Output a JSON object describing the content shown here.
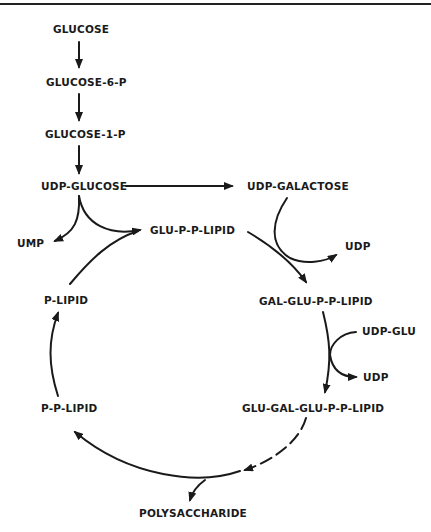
{
  "diagram": {
    "type": "metabolic-pathway",
    "nodes": {
      "glucose": "GLUCOSE",
      "glucose_6_p": "GLUCOSE-6-P",
      "glucose_1_p": "GLUCOSE-1-P",
      "udp_glucose": "UDP-GLUCOSE",
      "udp_galactose": "UDP-GALACTOSE",
      "ump": "UMP",
      "glu_p_p_lipid": "GLU-P-P-LIPID",
      "udp_1": "UDP",
      "p_lipid": "P-LIPID",
      "gal_glu_p_p_lipid": "GAL-GLU-P-P-LIPID",
      "udp_glu": "UDP-GLU",
      "udp_2": "UDP",
      "p_p_lipid": "P-P-LIPID",
      "glu_gal_glu_p_p_lipid": "GLU-GAL-GLU-P-P-LIPID",
      "polysaccharide": "POLYSACCHARIDE"
    },
    "edges": [
      {
        "from": "GLUCOSE",
        "to": "GLUCOSE-6-P"
      },
      {
        "from": "GLUCOSE-6-P",
        "to": "GLUCOSE-1-P"
      },
      {
        "from": "GLUCOSE-1-P",
        "to": "UDP-GLUCOSE"
      },
      {
        "from": "UDP-GLUCOSE",
        "to": "UDP-GALACTOSE"
      },
      {
        "from": "UDP-GLUCOSE",
        "to": "UMP"
      },
      {
        "from": "UDP-GLUCOSE",
        "to": "GLU-P-P-LIPID"
      },
      {
        "from": "P-LIPID",
        "to": "GLU-P-P-LIPID"
      },
      {
        "from": "GLU-P-P-LIPID",
        "to": "GAL-GLU-P-P-LIPID"
      },
      {
        "from": "UDP-GALACTOSE",
        "to": "UDP"
      },
      {
        "from": "GAL-GLU-P-P-LIPID",
        "to": "GLU-GAL-GLU-P-P-LIPID"
      },
      {
        "from": "UDP-GLU",
        "to": "UDP"
      },
      {
        "from": "GLU-GAL-GLU-P-P-LIPID",
        "to": "POLYSACCHARIDE",
        "style": "dashed"
      },
      {
        "from": "GLU-GAL-GLU-P-P-LIPID",
        "to": "P-P-LIPID"
      },
      {
        "from": "P-P-LIPID",
        "to": "P-LIPID"
      }
    ]
  }
}
